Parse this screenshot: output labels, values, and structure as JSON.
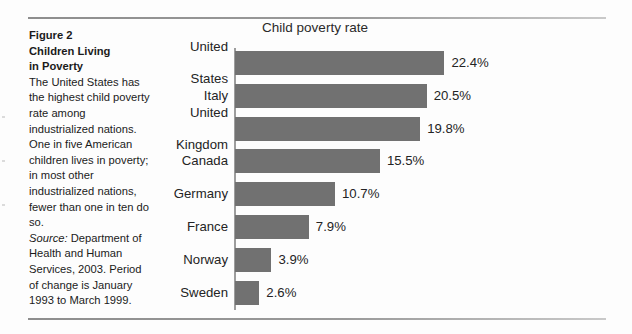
{
  "figure": {
    "heading_lines": [
      "Figure 2",
      "Children Living",
      "in Poverty"
    ],
    "body_text": "The United States has the highest child poverty rate among industrialized nations. One in five American children lives in poverty; in most other industrialized nations, fewer than one in ten do so.",
    "source_label": "Source:",
    "source_text": " Department of Health and Human Services, 2003. Period of change is January 1993 to March 1999."
  },
  "chart_data": {
    "type": "bar",
    "orientation": "horizontal",
    "title": "Child poverty rate",
    "xlabel": "",
    "ylabel": "",
    "grid": false,
    "legend": null,
    "xlim": [
      0,
      24
    ],
    "value_suffix": "%",
    "bar_color": "#717171",
    "categories": [
      "United States",
      "Italy",
      "United Kingdom",
      "Canada",
      "Germany",
      "France",
      "Norway",
      "Sweden"
    ],
    "values": [
      22.4,
      20.5,
      19.8,
      15.5,
      10.7,
      7.9,
      3.9,
      2.6
    ],
    "value_labels": [
      "22.4%",
      "20.5%",
      "19.8%",
      "15.5%",
      "10.7%",
      "7.9%",
      "3.9%",
      "2.6%"
    ]
  }
}
